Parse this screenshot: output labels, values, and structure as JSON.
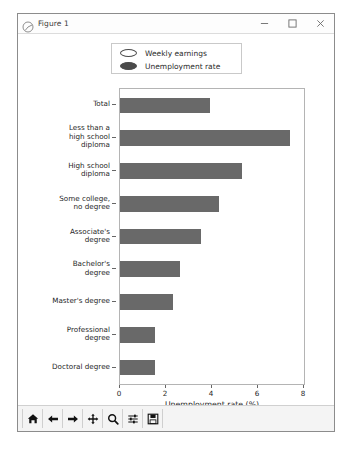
{
  "window": {
    "title": "Figure 1",
    "app_icon": "matplotlib-figure-icon",
    "controls": [
      {
        "name": "minimize-button",
        "glyph": "minimize-icon"
      },
      {
        "name": "maximize-button",
        "glyph": "maximize-icon"
      },
      {
        "name": "close-button",
        "glyph": "close-icon"
      }
    ]
  },
  "toolbar": {
    "buttons": [
      {
        "name": "home-button",
        "icon": "home-icon"
      },
      {
        "name": "back-button",
        "icon": "arrow-left-icon"
      },
      {
        "name": "forward-button",
        "icon": "arrow-right-icon"
      },
      {
        "name": "pan-button",
        "icon": "move-cross-icon"
      },
      {
        "name": "zoom-button",
        "icon": "magnifier-icon"
      },
      {
        "name": "configure-subplots-button",
        "icon": "sliders-icon"
      },
      {
        "name": "save-button",
        "icon": "floppy-disk-icon"
      }
    ]
  },
  "chart_data": {
    "type": "bar",
    "orientation": "horizontal",
    "title": "",
    "xlabel": "Unemployment rate (%)",
    "ylabel": "",
    "xlim": [
      0,
      8
    ],
    "xticks": [
      0,
      2,
      4,
      6,
      8
    ],
    "grid": false,
    "legend_position": "upper center (outside axes)",
    "legend": [
      {
        "label": "Weekly earnings",
        "marker": "ellipse",
        "facecolor": "#ffffff",
        "edgecolor": "#4a4a4a"
      },
      {
        "label": "Unemployment rate",
        "marker": "ellipse",
        "facecolor": "#4a4a4a",
        "edgecolor": "#4a4a4a"
      }
    ],
    "bar_color": "#696969",
    "categories": [
      "Total",
      "Less than a\nhigh school\ndiploma",
      "High school\ndiploma",
      "Some college,\nno degree",
      "Associate's\ndegree",
      "Bachelor's\ndegree",
      "Master's degree",
      "Professional\ndegree",
      "Doctoral degree"
    ],
    "series": [
      {
        "name": "Unemployment rate",
        "values": [
          3.9,
          7.4,
          5.3,
          4.3,
          3.5,
          2.6,
          2.3,
          1.5,
          1.5
        ]
      }
    ]
  }
}
